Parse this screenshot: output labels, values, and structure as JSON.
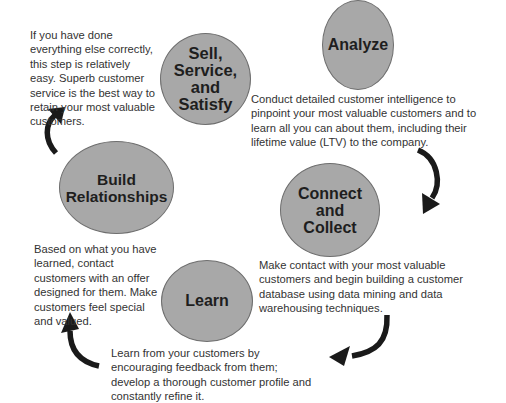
{
  "diagram": {
    "type": "cycle",
    "colors": {
      "node_fill": "#a8a8a8",
      "node_border": "#6e6e6e",
      "arrow": "#1a1a1a",
      "text": "#333333"
    },
    "steps": [
      {
        "id": "analyze",
        "label": "Analyze",
        "description": "Conduct detailed customer intelligence to pinpoint your most valuable customers and to learn all you can about them, including their lifetime value (LTV) to the company."
      },
      {
        "id": "connect",
        "label": "Connect\nand\nCollect",
        "description": "Make contact with your most valuable customers and begin building a customer database using data mining and data warehousing techniques."
      },
      {
        "id": "learn",
        "label": "Learn",
        "description": "Learn from your customers by encouraging feedback from them; develop a thorough customer profile and constantly refine it."
      },
      {
        "id": "build",
        "label": "Build\nRelationships",
        "description": "Based on what you have learned, contact customers with an offer designed for them. Make customers feel special and valued."
      },
      {
        "id": "sell",
        "label": "Sell,\nService,\nand\nSatisfy",
        "description": "If you have done everything else correctly, this step is relatively easy. Superb customer service is the best way to retain your most valuable customers."
      }
    ],
    "arrows": [
      {
        "from": "analyze",
        "to": "connect",
        "icon": "curved-arrow-down"
      },
      {
        "from": "connect",
        "to": "learn",
        "icon": "curved-arrow-left"
      },
      {
        "from": "learn",
        "to": "build",
        "icon": "curved-arrow-up"
      },
      {
        "from": "build",
        "to": "sell",
        "icon": "curved-arrow-up-right"
      }
    ]
  }
}
